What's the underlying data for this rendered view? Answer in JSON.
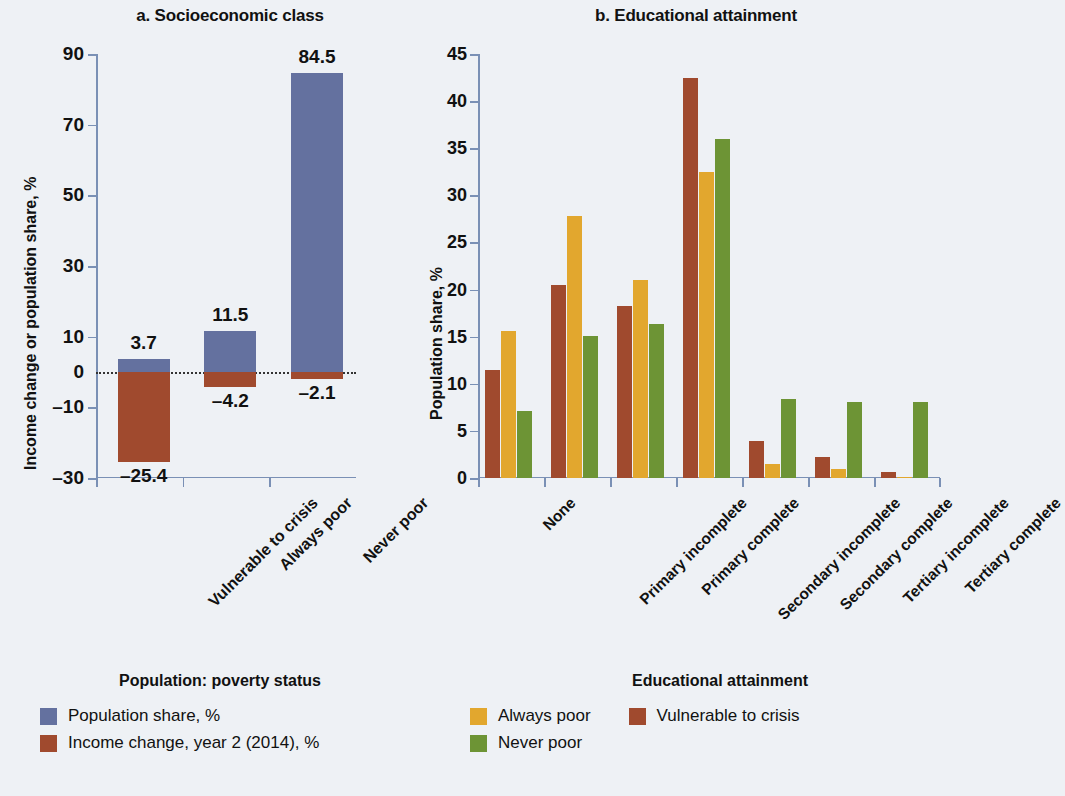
{
  "colors": {
    "blue": "#64719f",
    "red": "#a04a2e",
    "gold": "#e2a72e",
    "green": "#6d9435",
    "background": "#eef1f5",
    "axis": "#7a90b5"
  },
  "panel_a": {
    "title": "a. Socioeconomic class",
    "ylabel": "Income change or population share, %",
    "legend_title": "Population: poverty status",
    "legend": [
      {
        "label": "Population share, %",
        "color_key": "blue"
      },
      {
        "label": "Income change, year 2 (2014), %",
        "color_key": "red"
      }
    ]
  },
  "panel_b": {
    "title": "b. Educational attainment",
    "ylabel": "Population share, %",
    "legend_title": "Educational attainment",
    "legend": [
      {
        "label": "Always poor",
        "color_key": "gold"
      },
      {
        "label": "Never poor",
        "color_key": "green"
      },
      {
        "label": "Vulnerable to crisis",
        "color_key": "red"
      }
    ]
  },
  "chart_data": [
    {
      "type": "bar",
      "title": "a. Socioeconomic class",
      "xlabel": "Population: poverty status",
      "ylabel": "Income change or population share, %",
      "ylim": [
        -30,
        90
      ],
      "yticks": [
        -30,
        -10,
        0,
        10,
        30,
        50,
        70,
        90
      ],
      "ytick_labels": [
        "–30",
        "–10",
        "0",
        "10",
        "30",
        "50",
        "70",
        "90"
      ],
      "grid": false,
      "zero_line": true,
      "legend_position": "below-left",
      "categories": [
        "Vulnerable to crisis",
        "Always poor",
        "Never poor"
      ],
      "series": [
        {
          "name": "Population share, %",
          "color_key": "blue",
          "values": [
            3.7,
            11.5,
            84.5
          ],
          "data_labels": [
            "3.7",
            "11.5",
            "84.5"
          ]
        },
        {
          "name": "Income change, year 2 (2014), %",
          "color_key": "red",
          "values": [
            -25.4,
            -4.2,
            -2.1
          ],
          "data_labels": [
            "–25.4",
            "–4.2",
            "–2.1"
          ]
        }
      ]
    },
    {
      "type": "bar",
      "title": "b. Educational attainment",
      "xlabel": "Educational attainment",
      "ylabel": "Population share, %",
      "ylim": [
        0,
        45
      ],
      "yticks": [
        0,
        5,
        10,
        15,
        20,
        25,
        30,
        35,
        40,
        45
      ],
      "ytick_labels": [
        "0",
        "5",
        "10",
        "15",
        "20",
        "25",
        "30",
        "35",
        "40",
        "45"
      ],
      "grid": false,
      "legend_position": "below-right",
      "categories": [
        "None",
        "Primary incomplete",
        "Primary complete",
        "Secondary incomplete",
        "Secondary complete",
        "Tertiary incomplete",
        "Tertiary complete"
      ],
      "series": [
        {
          "name": "Vulnerable to crisis",
          "color_key": "red",
          "values": [
            11.5,
            20.5,
            18.3,
            42.5,
            3.9,
            2.2,
            0.6
          ]
        },
        {
          "name": "Always poor",
          "color_key": "gold",
          "values": [
            15.6,
            27.8,
            21.0,
            32.5,
            1.5,
            1.0,
            0.1
          ]
        },
        {
          "name": "Never poor",
          "color_key": "green",
          "values": [
            7.1,
            15.1,
            16.3,
            36.0,
            8.4,
            8.1,
            8.1
          ]
        }
      ]
    }
  ]
}
